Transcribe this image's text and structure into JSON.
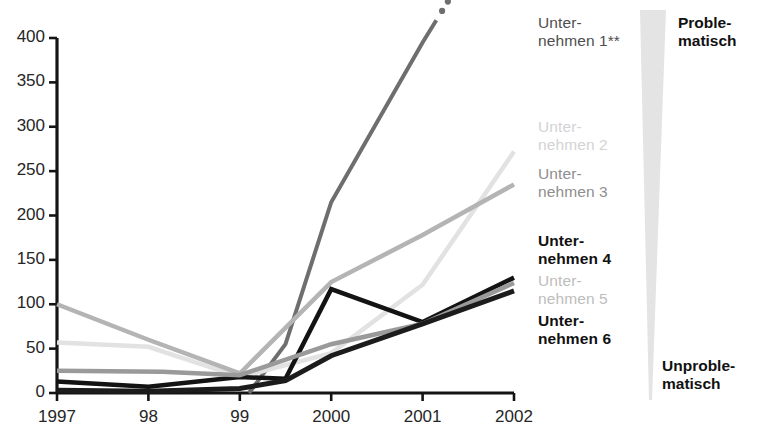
{
  "chart_data": {
    "type": "line",
    "title": "",
    "xlabel": "",
    "ylabel": "",
    "x": [
      1997,
      1998,
      1999,
      2000,
      2001,
      2002
    ],
    "xtick_labels": [
      "1997",
      "98",
      "99",
      "2000",
      "2001",
      "2002"
    ],
    "ytick_labels": [
      "0",
      "50",
      "100",
      "150",
      "200",
      "250",
      "300",
      "350",
      "400"
    ],
    "ytick_values": [
      0,
      50,
      100,
      150,
      200,
      250,
      300,
      350,
      400
    ],
    "ylim": [
      0,
      400
    ],
    "grid": false,
    "legend_position": "right",
    "series": [
      {
        "name": "Unternehmen 1**",
        "color": "#6e6e6e",
        "width": 4.0,
        "dashed_extension": true,
        "x": [
          1999.1,
          1999.5,
          2000,
          2001,
          2001.15
        ],
        "values": [
          0,
          55,
          215,
          395,
          420
        ]
      },
      {
        "name": "Unternehmen 2",
        "color": "#e2e2e2",
        "width": 4.5,
        "x": [
          1997,
          1998,
          1999,
          2000,
          2001,
          2002
        ],
        "values": [
          57,
          52,
          18,
          45,
          122,
          272
        ]
      },
      {
        "name": "Unternehmen 3",
        "color": "#b4b4b4",
        "width": 4.5,
        "x": [
          1997,
          1998,
          1999,
          2000,
          2001,
          2002
        ],
        "values": [
          100,
          60,
          22,
          125,
          178,
          235
        ]
      },
      {
        "name": "Unternehmen 4",
        "color": "#131313",
        "width": 4.5,
        "x": [
          1997,
          1998,
          1999,
          1999.5,
          2000,
          2001,
          2002
        ],
        "values": [
          13,
          7,
          18,
          16,
          117,
          80,
          130
        ]
      },
      {
        "name": "Unternehmen 5",
        "color": "#9a9a9a",
        "width": 4.5,
        "x": [
          1997,
          1998.15,
          1999,
          2000,
          2001,
          2002
        ],
        "values": [
          25,
          24,
          20,
          55,
          78,
          124
        ]
      },
      {
        "name": "Unternehmen 6",
        "color": "#1c1c1c",
        "width": 5.0,
        "x": [
          1997,
          1998,
          1999,
          1999.5,
          2000,
          2001,
          2002
        ],
        "values": [
          3,
          2,
          5,
          14,
          42,
          78,
          115
        ]
      }
    ],
    "annotations": {
      "wedge_top_label": "Proble-\nmatisch",
      "wedge_bottom_label": "Unproble-\nmatisch"
    }
  },
  "legend": {
    "items": [
      {
        "line1": "Unter-",
        "line2": "nehmen 1**",
        "style": "dark"
      },
      {
        "line1": "Unter-",
        "line2": "nehmen 2",
        "style": "light"
      },
      {
        "line1": "Unter-",
        "line2": "nehmen 3",
        "style": "mid"
      },
      {
        "line1": "Unter-",
        "line2": "nehmen 4",
        "style": "bold"
      },
      {
        "line1": "Unter-",
        "line2": "nehmen 5",
        "style": "light2"
      },
      {
        "line1": "Unter-",
        "line2": "nehmen 6",
        "style": "bold"
      }
    ]
  },
  "wedge": {
    "top_line1": "Proble-",
    "top_line2": "matisch",
    "bottom_line1": "Unproble-",
    "bottom_line2": "matisch",
    "color": "#e4e4e4"
  },
  "axis": {
    "x_labels": [
      "1997",
      "98",
      "99",
      "2000",
      "2001",
      "2002"
    ],
    "y_labels": [
      "400",
      "350",
      "300",
      "250",
      "200",
      "150",
      "100",
      "50",
      "0"
    ]
  }
}
